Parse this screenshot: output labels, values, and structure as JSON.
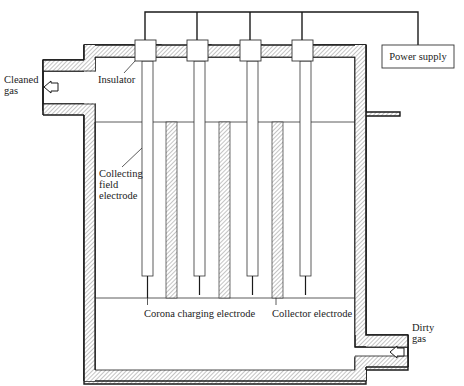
{
  "diagram": {
    "labels": {
      "cleaned_gas_line1": "Cleaned",
      "cleaned_gas_line2": "gas",
      "insulator": "Insulator",
      "collecting_line1": "Collecting",
      "collecting_line2": "field",
      "collecting_line3": "electrode",
      "corona": "Corona charging electrode",
      "collector": "Collector electrode",
      "dirty_gas_line1": "Dirty",
      "dirty_gas_line2": "gas",
      "power_supply": "Power supply"
    },
    "components": {
      "discharge_electrodes": 4,
      "collector_plates": 3,
      "insulators": 4
    },
    "colors": {
      "line": "#1a1a1a",
      "hatch": "#888888",
      "background": "#ffffff"
    }
  }
}
